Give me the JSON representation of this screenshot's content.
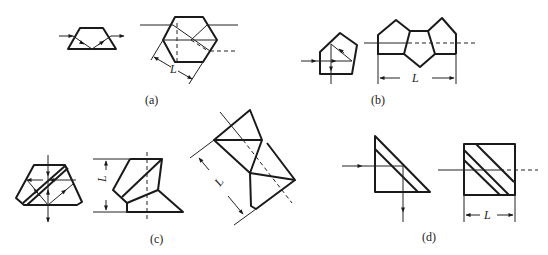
{
  "figure": {
    "panels": [
      {
        "id": "a",
        "caption": "(a)",
        "dimension_label": "L",
        "description": "Trapezoid (Dove) prism and hexagonal prism with ray paths"
      },
      {
        "id": "b",
        "caption": "(b)",
        "dimension_label": "L",
        "description": "Pentaprism and unfolded tunnel diagram"
      },
      {
        "id": "c",
        "caption": "(c)",
        "dimension_label": "L",
        "description": "Compound prism with reflecting surfaces and unfolded diagrams"
      },
      {
        "id": "d",
        "caption": "(d)",
        "dimension_label": "L",
        "description": "Right-angle prism with layered hypotenuse and unfolded cube"
      }
    ]
  }
}
